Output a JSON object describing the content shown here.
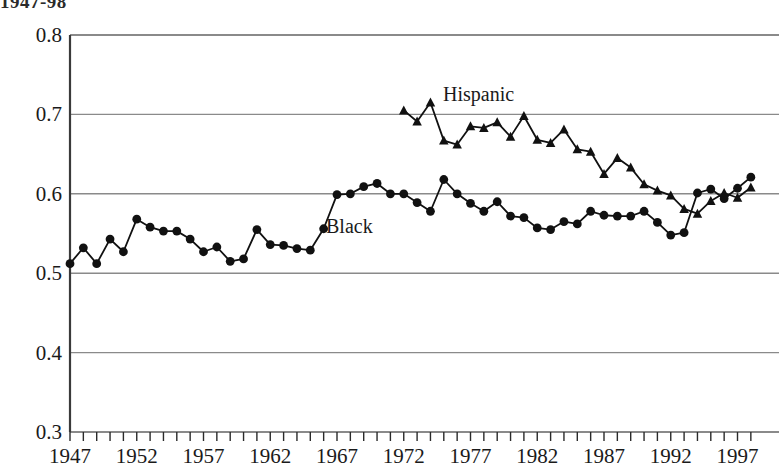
{
  "title_fragment": "1947-98",
  "chart_data": {
    "type": "line",
    "title": "1947-98",
    "xlabel": "",
    "ylabel": "",
    "xlim": [
      1947,
      1998
    ],
    "ylim": [
      0.3,
      0.8
    ],
    "yticks": [
      "0.3",
      "0.4",
      "0.5",
      "0.6",
      "0.7",
      "0.8"
    ],
    "ytick_values": [
      0.3,
      0.4,
      0.5,
      0.6,
      0.7,
      0.8
    ],
    "xticks": [
      "1947",
      "1952",
      "1957",
      "1962",
      "1967",
      "1972",
      "1977",
      "1982",
      "1987",
      "1992",
      "1997"
    ],
    "xtick_values": [
      1947,
      1952,
      1957,
      1962,
      1967,
      1972,
      1977,
      1982,
      1987,
      1992,
      1997
    ],
    "grid": "horizontal",
    "legend_position": "inline-annotation",
    "series": [
      {
        "name": "Black",
        "marker": "circle",
        "x": [
          1947,
          1948,
          1949,
          1950,
          1951,
          1952,
          1953,
          1954,
          1955,
          1956,
          1957,
          1958,
          1959,
          1960,
          1961,
          1962,
          1963,
          1964,
          1965,
          1966,
          1967,
          1968,
          1969,
          1970,
          1971,
          1972,
          1973,
          1974,
          1975,
          1976,
          1977,
          1978,
          1979,
          1980,
          1981,
          1982,
          1983,
          1984,
          1985,
          1986,
          1987,
          1988,
          1989,
          1990,
          1991,
          1992,
          1993,
          1994,
          1995,
          1996,
          1997,
          1998
        ],
        "values": [
          0.512,
          0.532,
          0.512,
          0.543,
          0.527,
          0.568,
          0.558,
          0.553,
          0.553,
          0.543,
          0.527,
          0.533,
          0.515,
          0.518,
          0.555,
          0.536,
          0.535,
          0.531,
          0.529,
          0.556,
          0.599,
          0.6,
          0.609,
          0.613,
          0.6,
          0.6,
          0.589,
          0.578,
          0.618,
          0.6,
          0.588,
          0.578,
          0.59,
          0.572,
          0.57,
          0.557,
          0.555,
          0.565,
          0.562,
          0.578,
          0.573,
          0.572,
          0.572,
          0.578,
          0.564,
          0.548,
          0.551,
          0.601,
          0.606,
          0.594,
          0.607,
          0.621
        ]
      },
      {
        "name": "Hispanic",
        "marker": "triangle",
        "x": [
          1972,
          1973,
          1974,
          1975,
          1976,
          1977,
          1978,
          1979,
          1980,
          1981,
          1982,
          1983,
          1984,
          1985,
          1986,
          1987,
          1988,
          1989,
          1990,
          1991,
          1992,
          1993,
          1994,
          1995,
          1996,
          1997,
          1998
        ],
        "values": [
          0.705,
          0.691,
          0.715,
          0.667,
          0.662,
          0.685,
          0.683,
          0.69,
          0.672,
          0.698,
          0.668,
          0.664,
          0.681,
          0.656,
          0.653,
          0.625,
          0.645,
          0.633,
          0.612,
          0.604,
          0.598,
          0.581,
          0.575,
          0.591,
          0.601,
          0.595,
          0.608
        ]
      }
    ]
  },
  "annotations": [
    {
      "text": "Black",
      "series": "Black"
    },
    {
      "text": "Hispanic",
      "series": "Hispanic"
    }
  ]
}
